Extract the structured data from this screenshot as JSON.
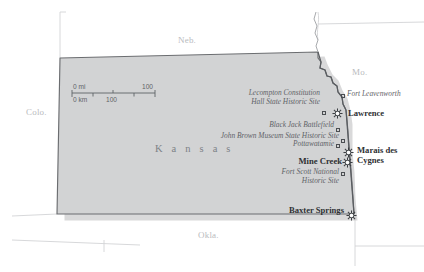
{
  "map": {
    "title": "Kansas",
    "subject_state": "Kansas",
    "colors": {
      "state_fill": "#d2d3d4",
      "state_outline": "#6b6d70",
      "neighbor_line": "#cfd0d2",
      "site_label": "#5f6368",
      "city_label": "#2e3033",
      "neighbor_label": "#b9bbbe",
      "background": "#ffffff"
    },
    "state_name_label": "K a n s a s",
    "neighbors": [
      {
        "name": "neighbor-nebraska",
        "label": "Neb.",
        "x": 178,
        "y": 41
      },
      {
        "name": "neighbor-missouri",
        "label": "Mo.",
        "x": 352,
        "y": 73
      },
      {
        "name": "neighbor-colorado",
        "label": "Colo.",
        "x": 26,
        "y": 113
      },
      {
        "name": "neighbor-oklahoma",
        "label": "Okla.",
        "x": 198,
        "y": 236
      }
    ],
    "scale_bar": {
      "name": "scale-bar",
      "miles_unit_label": "0 mi",
      "miles_max_label": "100",
      "km_unit_label": "0 km",
      "km_mid_label": "100"
    },
    "sites": [
      {
        "name": "site-lecompton-constitution-hall",
        "label": "Lecompton Constitution\nHall State Historic Site",
        "line1": "Lecompton Constitution",
        "line2": "Hall State Historic Site",
        "marker_x": 322,
        "marker_y": 111,
        "label_x": 222,
        "label_y": 93,
        "label_w": 98
      },
      {
        "name": "site-black-jack-battlefield",
        "label": "Black Jack Battlefield",
        "line1": "Black Jack Battlefield",
        "marker_x": 336,
        "marker_y": 128,
        "label_x": 256,
        "label_y": 120,
        "label_w": 78
      },
      {
        "name": "site-john-brown-museum",
        "label": "John Brown Museum State Historic Site",
        "line1": "John Brown Museum State Historic Site",
        "marker_x": 341,
        "marker_y": 139,
        "label_x": 203,
        "label_y": 131,
        "label_w": 136
      },
      {
        "name": "site-pottawatamie",
        "label": "Pottawatamie",
        "line1": "Pottawatamie",
        "marker_x": 336,
        "marker_y": 144,
        "label_x": 280,
        "label_y": 140,
        "label_w": 54
      },
      {
        "name": "site-fort-leavenworth",
        "label": "Fort Leavenworth",
        "line1": "Fort Leavenworth",
        "marker_x": 341,
        "marker_y": 94,
        "label_x": 347,
        "label_y": 90,
        "align": "left"
      },
      {
        "name": "site-fort-scott-national-historic-site",
        "label": "Fort Scott National\nHistoric Site",
        "line1": "Fort Scott National",
        "line2": "Historic Site",
        "marker_x": 341,
        "marker_y": 172,
        "label_x": 277,
        "label_y": 171,
        "label_w": 62
      }
    ],
    "cities": [
      {
        "name": "city-lawrence",
        "label": "Lawrence",
        "marker_x": 337,
        "marker_y": 113,
        "label_x": 348,
        "label_y": 111,
        "align": "left"
      },
      {
        "name": "city-marais-des-cygnes",
        "label": "Marais des\nCygnes",
        "line1": "Marais des",
        "line2": "Cygnes",
        "marker_x": 348,
        "marker_y": 153,
        "label_x": 357,
        "label_y": 148,
        "align": "left"
      },
      {
        "name": "city-mine-creek",
        "label": "Mine Creek",
        "line1": "Mine Creek",
        "marker_x": 348,
        "marker_y": 162,
        "label_x": 290,
        "label_y": 157,
        "align": "right"
      },
      {
        "name": "city-baxter-springs",
        "label": "Baxter Springs",
        "line1": "Baxter Springs",
        "marker_x": 351,
        "marker_y": 215,
        "label_x": 279,
        "label_y": 208,
        "align": "right"
      }
    ]
  }
}
